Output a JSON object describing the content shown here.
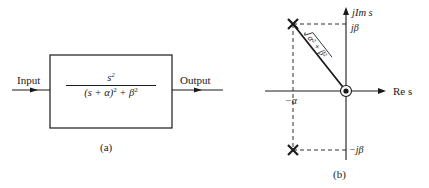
{
  "panel_a": {
    "input_label": "Input",
    "output_label": "Output",
    "transfer_function": {
      "numerator_base": "s",
      "numerator_exp": "2",
      "denominator_part1": "(s + α)",
      "denominator_exp1": "2",
      "denominator_part2": " + β",
      "denominator_exp2": "2"
    },
    "caption": "(a)"
  },
  "panel_b": {
    "imag_axis_label": "jIm s",
    "real_axis_label": "Re s",
    "pos_imag_tick": "jβ",
    "neg_imag_tick": "−jβ",
    "real_tick": "−α",
    "radius_label": "√α² + β²",
    "poles": [
      {
        "re": "−α",
        "im": "jβ",
        "marker": "x"
      },
      {
        "re": "−α",
        "im": "−jβ",
        "marker": "x"
      }
    ],
    "zeros": [
      {
        "re": "0",
        "im": "0",
        "marker": "double-circle",
        "order": 2
      }
    ],
    "caption": "(b)"
  },
  "colors": {
    "ink": "#1a1a1a",
    "background": "#ffffff"
  }
}
